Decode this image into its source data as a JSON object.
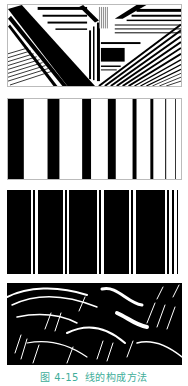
{
  "figure": {
    "caption_number": "图 4-15",
    "caption_title": "线的构成方法",
    "caption_color": "#3fae9a"
  },
  "panels": [
    {
      "id": "panel-1",
      "description": "diagonal and horizontal line composition"
    },
    {
      "id": "panel-2",
      "description": "vertical stripes decreasing in width"
    },
    {
      "id": "panel-3",
      "description": "wide black bars separated by thin white lines"
    },
    {
      "id": "panel-4",
      "description": "organic brush-stroke line texture"
    }
  ]
}
